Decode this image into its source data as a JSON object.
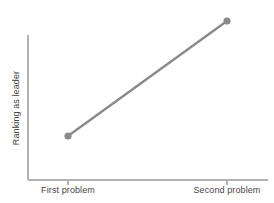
{
  "chart_data": {
    "type": "line",
    "title": "",
    "subtitle": "",
    "xlabel": "",
    "ylabel": "Ranking as leader",
    "categories": [
      "First problem",
      "Second problem"
    ],
    "tick_labels": {
      "x": [
        "First problem",
        "Second problem"
      ],
      "y": []
    },
    "series": [
      {
        "name": "Ranking as leader",
        "values": [
          0.31,
          0.99
        ],
        "points": [
          {
            "x": "First problem",
            "y": 0.31
          },
          {
            "x": "Second problem",
            "y": 0.99
          }
        ],
        "color": "#8a8a8a",
        "marker": "circle",
        "line_width": 2.4
      }
    ],
    "xlim": [
      0,
      1
    ],
    "ylim": [
      0,
      1
    ],
    "grid": false,
    "legend": false,
    "legend_position": "none",
    "annotations": [],
    "axis_color": "#b2b2b2",
    "text_color": "#464646",
    "background_color": "#ffffff"
  },
  "geometry": {
    "axis": {
      "x_start": 28,
      "x_end": 268,
      "y_top": 35,
      "y_baseline": 180
    },
    "ticks": [
      {
        "label": "First problem",
        "x": 68
      },
      {
        "label": "Second problem",
        "x": 227
      }
    ],
    "points": [
      {
        "cx": 68,
        "cy": 136,
        "r": 3.6
      },
      {
        "cx": 227,
        "cy": 21,
        "r": 3.6
      }
    ]
  }
}
